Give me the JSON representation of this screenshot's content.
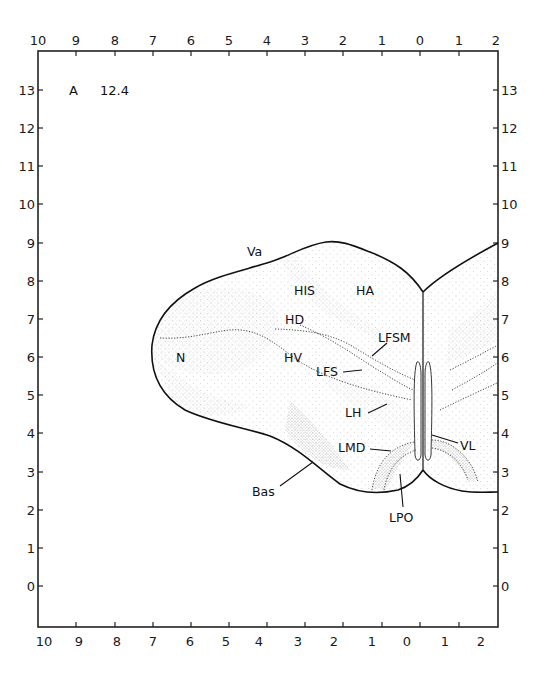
{
  "plate": {
    "section_letter": "A",
    "section_value": "12.4"
  },
  "axes": {
    "top_x_ticks": [
      "10",
      "9",
      "8",
      "7",
      "6",
      "5",
      "4",
      "3",
      "2",
      "1",
      "0",
      "1",
      "2"
    ],
    "bottom_x_ticks": [
      "10",
      "9",
      "8",
      "7",
      "6",
      "5",
      "4",
      "3",
      "2",
      "1",
      "0",
      "1",
      "2"
    ],
    "left_y_ticks": [
      "13",
      "12",
      "11",
      "10",
      "9",
      "8",
      "7",
      "6",
      "5",
      "4",
      "3",
      "2",
      "1",
      "0"
    ],
    "right_y_ticks": [
      "13",
      "12",
      "11",
      "10",
      "9",
      "8",
      "7",
      "6",
      "5",
      "4",
      "3",
      "2",
      "1",
      "0"
    ]
  },
  "regions": {
    "va": "Va",
    "his": "HIS",
    "ha": "HA",
    "hd": "HD",
    "hv": "HV",
    "n": "N",
    "lfsm": "LFSM",
    "lfs": "LFS",
    "lh": "LH",
    "lmd": "LMD",
    "vl": "VL",
    "bas": "Bas",
    "lpo": "LPO"
  },
  "colors": {
    "ink": "#111111",
    "stipple": "#8a8a8a",
    "background": "#ffffff"
  }
}
